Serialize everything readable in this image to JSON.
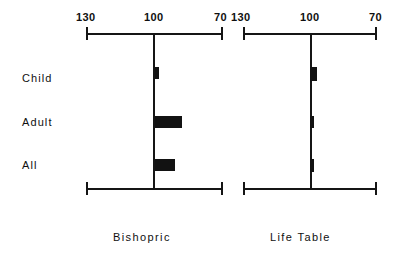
{
  "chart_data": {
    "type": "bar",
    "title": "",
    "orientation": "horizontal",
    "xlabel": "",
    "ylabel": "",
    "xlim": [
      130,
      70
    ],
    "axis_reversed": true,
    "grid": false,
    "legend": "none",
    "reference_value": 100,
    "categories": [
      "Child",
      "Adult",
      "All"
    ],
    "tick_labels": [
      "130",
      "100",
      "70"
    ],
    "tick_values": [
      130,
      100,
      70
    ],
    "panels": [
      {
        "name": "Bishopric",
        "label": "Bishopric",
        "values": [
          98,
          88,
          91
        ],
        "bars": [
          {
            "category": "Child",
            "value": 98
          },
          {
            "category": "Adult",
            "value": 88
          },
          {
            "category": "All",
            "value": 91
          }
        ]
      },
      {
        "name": "Life Table",
        "label": "Life  Table",
        "values": [
          97,
          99,
          98
        ],
        "bars": [
          {
            "category": "Child",
            "value": 97
          },
          {
            "category": "Adult",
            "value": 99
          },
          {
            "category": "All",
            "value": 98
          }
        ]
      }
    ]
  },
  "colors": {
    "bar": "#121212",
    "axis": "#151515",
    "text": "#101010",
    "background": "#ffffff"
  },
  "labels": {
    "category_child": "Child",
    "category_adult": "Adult",
    "category_all": "All",
    "panel_left_title": "Bishopric",
    "panel_right_title": "Life  Table",
    "tick_left": "130",
    "tick_mid": "100",
    "tick_right": "70",
    "tick_left_b": "130",
    "tick_mid_b": "100",
    "tick_right_b": "70"
  }
}
